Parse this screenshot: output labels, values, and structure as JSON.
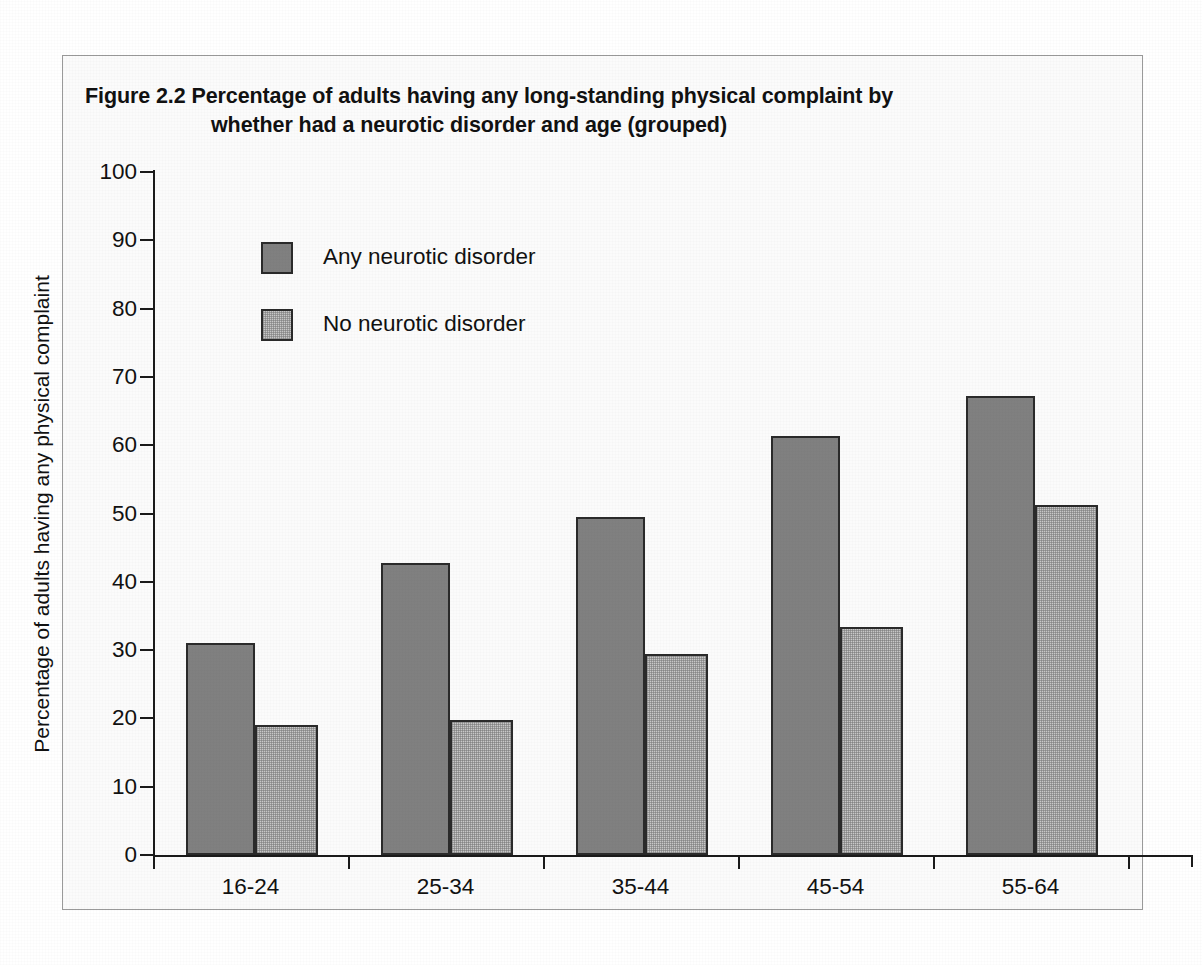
{
  "figure": {
    "title_line1": "Figure 2.2  Percentage of adults having any long-standing physical complaint by",
    "title_line2": "whether had a neurotic disorder and age (grouped)"
  },
  "chart_data": {
    "type": "bar",
    "title": "Figure 2.2  Percentage of adults having any long-standing physical complaint by whether had a neurotic disorder and age (grouped)",
    "xlabel": "",
    "ylabel": "Percentage of adults having any physical complaint",
    "categories": [
      "16-24",
      "25-34",
      "35-44",
      "45-54",
      "55-64"
    ],
    "series": [
      {
        "name": "Any neurotic disorder",
        "color": "#808080",
        "values": [
          31.0,
          42.8,
          49.5,
          61.4,
          67.2
        ]
      },
      {
        "name": "No neurotic disorder",
        "color": "#c9c9c9",
        "values": [
          19.0,
          19.8,
          29.5,
          33.4,
          51.2
        ]
      }
    ],
    "ylim": [
      0,
      100
    ],
    "ytick_values": [
      0,
      10,
      20,
      30,
      40,
      50,
      60,
      70,
      80,
      90,
      100
    ],
    "ytick_labels": [
      "0",
      "10",
      "20",
      "30",
      "40",
      "50",
      "60",
      "70",
      "80",
      "90",
      "100"
    ],
    "grid": false,
    "legend_position": "top-left"
  }
}
